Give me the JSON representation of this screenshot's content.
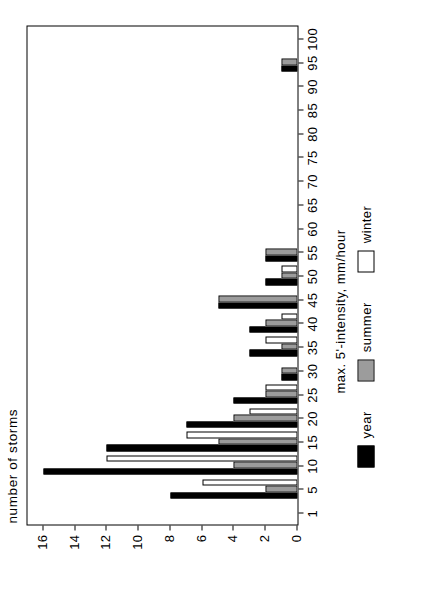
{
  "chart_data": {
    "type": "bar",
    "title": "",
    "subtitle": "",
    "xlabel": "max. 5'-intensity, mm/hour",
    "ylabel": "number of storms",
    "orientation": "vertical-bars-rotated-90ccw",
    "grid": false,
    "legend_position": "below-axis",
    "categories": [
      "1",
      "5",
      "10",
      "15",
      "20",
      "25",
      "30",
      "35",
      "40",
      "45",
      "50",
      "55",
      "60",
      "65",
      "70",
      "75",
      "80",
      "85",
      "90",
      "95",
      "100"
    ],
    "xtick_labels": [
      "1",
      "5",
      "10",
      "15",
      "20",
      "25",
      "30",
      "35",
      "40",
      "45",
      "50",
      "55",
      "60",
      "65",
      "70",
      "75",
      "80",
      "85",
      "90",
      "95",
      "100"
    ],
    "ytick_labels": [
      "0",
      "2",
      "4",
      "6",
      "8",
      "10",
      "12",
      "14",
      "16"
    ],
    "ylim": [
      0,
      17
    ],
    "xlim": [
      0,
      21
    ],
    "series": [
      {
        "name": "year",
        "color": "#000000",
        "fill": "solid-black",
        "values": [
          0,
          8,
          16,
          12,
          7,
          4,
          1,
          3,
          3,
          5,
          2,
          2,
          0,
          0,
          0,
          0,
          0,
          0,
          0,
          1,
          0
        ]
      },
      {
        "name": "summer",
        "color": "#7a7a7a",
        "fill": "stippled-grey",
        "values": [
          0,
          2,
          4,
          5,
          4,
          2,
          1,
          1,
          2,
          5,
          1,
          2,
          0,
          0,
          0,
          0,
          0,
          0,
          0,
          1,
          0
        ]
      },
      {
        "name": "winter",
        "color": "#ffffff",
        "fill": "white-outline",
        "values": [
          0,
          6,
          12,
          7,
          3,
          2,
          0,
          2,
          1,
          0,
          1,
          0,
          0,
          0,
          0,
          0,
          0,
          0,
          0,
          0,
          0
        ]
      }
    ]
  },
  "legend": {
    "entries": [
      {
        "label": "year"
      },
      {
        "label": "summer"
      },
      {
        "label": "winter"
      }
    ]
  },
  "axes": {
    "x_title": "max. 5'-intensity, mm/hour",
    "y_title": "number of storms"
  },
  "colors": {
    "year": "#000000",
    "summer": "#7a7a7a",
    "winter": "#ffffff",
    "axis": "#000000",
    "background": "#ffffff"
  }
}
